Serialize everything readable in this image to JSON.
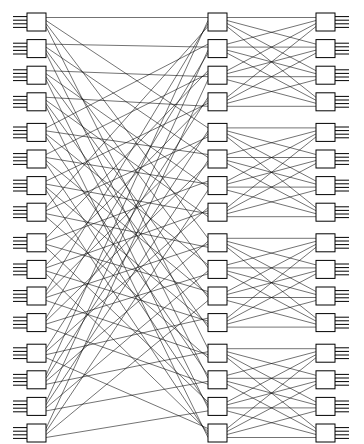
{
  "diagram": {
    "type": "network-topology",
    "canvas": {
      "width": 364,
      "height": 444,
      "background": "#ffffff"
    },
    "line_color": "#000000",
    "box_fill": "#ffffff",
    "box_stroke": "#000000",
    "stages": [
      {
        "id": "stage-ingress",
        "name": "input-switch-column",
        "label": "Input stage",
        "node_count": 16,
        "external_ports_per_node": 4,
        "external_port_side": "left",
        "box_x": 27,
        "box_width": 19,
        "box_height": 18,
        "first_box_y": 13,
        "row_pitch": 26.6
      },
      {
        "id": "stage-middle",
        "name": "middle-switch-column",
        "label": "Middle stage",
        "node_count": 16,
        "external_ports_per_node": 0,
        "external_port_side": "none",
        "box_x": 208,
        "box_width": 19,
        "box_height": 18,
        "first_box_y": 13,
        "row_pitch": 26.6
      },
      {
        "id": "stage-egress",
        "name": "output-switch-column",
        "label": "Output stage",
        "node_count": 16,
        "external_ports_per_node": 4,
        "external_port_side": "right",
        "box_x": 316,
        "box_width": 19,
        "box_height": 18,
        "first_box_y": 13,
        "row_pitch": 26.6
      }
    ],
    "groups": {
      "group_size": 4,
      "group_count": 4,
      "group_gap": 4
    },
    "link_sets": [
      {
        "id": "links-ingress-to-middle",
        "name": "ingress-middle-links",
        "from_stage": "stage-ingress",
        "to_stage": "stage-middle",
        "pattern": "shuffle",
        "fanout_per_node": 4,
        "description": "Each input switch sends one link into each of the four middle-stage groups"
      },
      {
        "id": "links-middle-to-egress",
        "name": "middle-egress-links",
        "from_stage": "stage-middle",
        "to_stage": "stage-egress",
        "pattern": "full-crossbar-within-group",
        "fanout_per_node": 4,
        "description": "Complete 4x4 bipartite crossbar between each middle group and the matching output group"
      }
    ],
    "port_stub": {
      "length": 14,
      "count_per_node": 4,
      "spacing": 3.6
    }
  }
}
